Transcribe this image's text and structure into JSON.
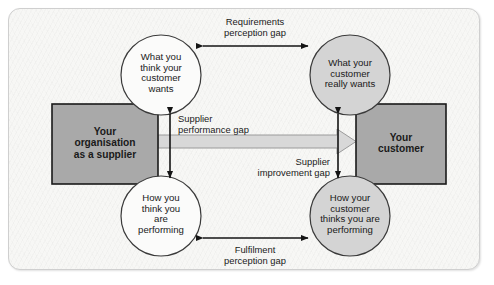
{
  "diagram": {
    "type": "gap-model",
    "nodes": {
      "supplier_box": {
        "line1": "Your",
        "line2": "organisation",
        "line3": "as a supplier"
      },
      "customer_box": {
        "line1": "Your",
        "line2": "customer"
      },
      "circle_top_left": {
        "line1": "What you",
        "line2": "think your",
        "line3": "customer",
        "line4": "wants"
      },
      "circle_top_right": {
        "line1": "What your",
        "line2": "customer",
        "line3": "really wants"
      },
      "circle_bottom_left": {
        "line1": "How you",
        "line2": "think you",
        "line3": "are",
        "line4": "performing"
      },
      "circle_bottom_right": {
        "line1": "How your",
        "line2": "customer",
        "line3": "thinks you are",
        "line4": "performing"
      }
    },
    "gaps": {
      "requirements": {
        "line1": "Requirements",
        "line2": "perception gap"
      },
      "supplier_performance": {
        "line1": "Supplier",
        "line2": "performance gap"
      },
      "supplier_improvement": {
        "line1": "Supplier",
        "line2": "improvement gap"
      },
      "fulfilment": {
        "line1": "Fulfilment",
        "line2": "perception gap"
      }
    },
    "colors": {
      "box_fill": "#a9a9a9",
      "box_stroke": "#1a1a1a",
      "circle_left_fill": "#fbfbfa",
      "circle_right_fill": "#d4d4d4",
      "circle_stroke": "#3a3a3a",
      "arrow": "#141414",
      "wide_arrow_fill": "#d8d8d8",
      "wide_arrow_stroke": "#8e8e8e",
      "frame_border": "#cfcfcf",
      "frame_bg": "#f7f7f5",
      "text": "#1a1a1a"
    }
  }
}
